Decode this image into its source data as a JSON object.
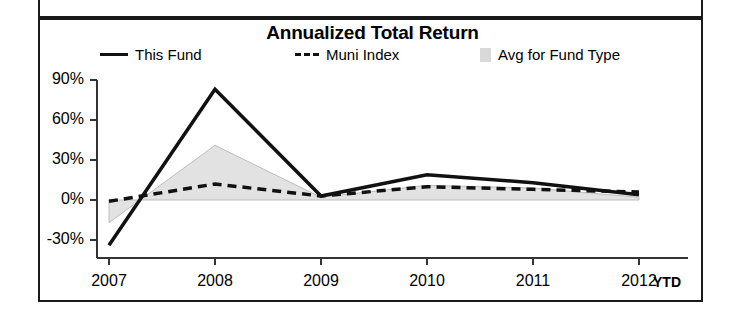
{
  "chart_data": {
    "type": "line",
    "title": "Annualized Total Return",
    "xlabel": "",
    "ylabel": "",
    "x": [
      "2007",
      "2008",
      "2009",
      "2010",
      "2011",
      "2012"
    ],
    "x_suffix_label": "YTD",
    "ylim": [
      -40,
      90
    ],
    "ytick_labels": [
      "90%",
      "60%",
      "30%",
      "0%",
      "-30%"
    ],
    "ytick_values": [
      90,
      60,
      30,
      0,
      -30
    ],
    "grid": false,
    "legend_position": "top",
    "series": [
      {
        "name": "This Fund",
        "style": "solid-line",
        "color": "#111111",
        "values": [
          -34,
          83,
          3,
          19,
          13,
          4
        ]
      },
      {
        "name": "Muni Index",
        "style": "dashed-line",
        "color": "#111111",
        "values": [
          -1,
          12,
          3,
          10,
          8,
          6
        ]
      },
      {
        "name": "Avg for Fund Type",
        "style": "shaded-area",
        "color": "#d9d9d9",
        "values": [
          -17,
          41,
          2,
          11,
          9,
          2
        ]
      }
    ]
  },
  "legend": {
    "items": [
      {
        "label": "This Fund",
        "key": "solid-line-key"
      },
      {
        "label": "Muni Index",
        "key": "dashed-line-key"
      },
      {
        "label": "Avg for Fund Type",
        "key": "gray-swatch-key"
      }
    ]
  },
  "axis": {
    "y_labels": [
      "90%",
      "60%",
      "30%",
      "0%",
      "-30%"
    ],
    "x_labels": [
      "2007",
      "2008",
      "2009",
      "2010",
      "2011",
      "2012"
    ],
    "ytd_label": "YTD"
  }
}
